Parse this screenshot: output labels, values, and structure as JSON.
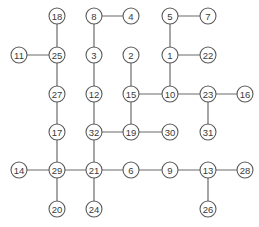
{
  "diagram": {
    "type": "tree-graph",
    "node_radius": 8,
    "colors": {
      "background": "#ffffff",
      "stroke": "#5a5a5a",
      "edge": "#6a6a6a",
      "text": "#3a3a3a"
    },
    "nodes": [
      {
        "id": "18",
        "label": "18",
        "x": 57,
        "y": 16
      },
      {
        "id": "8",
        "label": "8",
        "x": 94,
        "y": 16
      },
      {
        "id": "4",
        "label": "4",
        "x": 131,
        "y": 16
      },
      {
        "id": "5",
        "label": "5",
        "x": 170,
        "y": 16
      },
      {
        "id": "7",
        "label": "7",
        "x": 208,
        "y": 16
      },
      {
        "id": "11",
        "label": "11",
        "x": 19,
        "y": 55
      },
      {
        "id": "25",
        "label": "25",
        "x": 57,
        "y": 55
      },
      {
        "id": "3",
        "label": "3",
        "x": 94,
        "y": 55
      },
      {
        "id": "2",
        "label": "2",
        "x": 131,
        "y": 55
      },
      {
        "id": "1",
        "label": "1",
        "x": 170,
        "y": 55
      },
      {
        "id": "22",
        "label": "22",
        "x": 208,
        "y": 55
      },
      {
        "id": "27",
        "label": "27",
        "x": 57,
        "y": 94
      },
      {
        "id": "12",
        "label": "12",
        "x": 94,
        "y": 94
      },
      {
        "id": "15",
        "label": "15",
        "x": 131,
        "y": 94
      },
      {
        "id": "10",
        "label": "10",
        "x": 170,
        "y": 94
      },
      {
        "id": "23",
        "label": "23",
        "x": 208,
        "y": 94
      },
      {
        "id": "16",
        "label": "16",
        "x": 245,
        "y": 94
      },
      {
        "id": "17",
        "label": "17",
        "x": 57,
        "y": 132
      },
      {
        "id": "32",
        "label": "32",
        "x": 94,
        "y": 132
      },
      {
        "id": "19",
        "label": "19",
        "x": 131,
        "y": 132
      },
      {
        "id": "30",
        "label": "30",
        "x": 170,
        "y": 132
      },
      {
        "id": "31",
        "label": "31",
        "x": 208,
        "y": 132
      },
      {
        "id": "14",
        "label": "14",
        "x": 19,
        "y": 170
      },
      {
        "id": "29",
        "label": "29",
        "x": 57,
        "y": 170
      },
      {
        "id": "21",
        "label": "21",
        "x": 94,
        "y": 170
      },
      {
        "id": "6",
        "label": "6",
        "x": 131,
        "y": 170
      },
      {
        "id": "9",
        "label": "9",
        "x": 170,
        "y": 170
      },
      {
        "id": "13",
        "label": "13",
        "x": 208,
        "y": 170
      },
      {
        "id": "28",
        "label": "28",
        "x": 245,
        "y": 170
      },
      {
        "id": "20",
        "label": "20",
        "x": 57,
        "y": 209
      },
      {
        "id": "24",
        "label": "24",
        "x": 94,
        "y": 209
      },
      {
        "id": "26",
        "label": "26",
        "x": 208,
        "y": 209
      }
    ],
    "edges": [
      [
        "18",
        "25"
      ],
      [
        "11",
        "25"
      ],
      [
        "25",
        "27"
      ],
      [
        "27",
        "17"
      ],
      [
        "17",
        "29"
      ],
      [
        "14",
        "29"
      ],
      [
        "29",
        "20"
      ],
      [
        "29",
        "21"
      ],
      [
        "8",
        "4"
      ],
      [
        "8",
        "3"
      ],
      [
        "3",
        "12"
      ],
      [
        "12",
        "32"
      ],
      [
        "32",
        "21"
      ],
      [
        "21",
        "24"
      ],
      [
        "32",
        "19"
      ],
      [
        "19",
        "30"
      ],
      [
        "2",
        "15"
      ],
      [
        "15",
        "19"
      ],
      [
        "15",
        "10"
      ],
      [
        "5",
        "7"
      ],
      [
        "5",
        "1"
      ],
      [
        "1",
        "22"
      ],
      [
        "1",
        "10"
      ],
      [
        "10",
        "23"
      ],
      [
        "23",
        "16"
      ],
      [
        "23",
        "31"
      ],
      [
        "21",
        "6"
      ],
      [
        "6",
        "9"
      ],
      [
        "9",
        "13"
      ],
      [
        "13",
        "28"
      ],
      [
        "13",
        "26"
      ]
    ]
  }
}
